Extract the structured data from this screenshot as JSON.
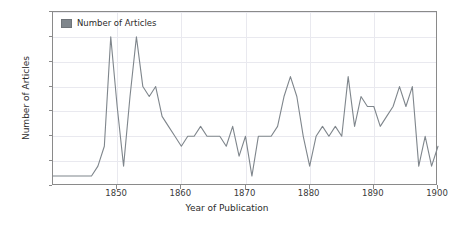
{
  "chart_data": {
    "type": "line",
    "title": "",
    "xlabel": "Year of Publication",
    "ylabel": "Number of Articles",
    "xlim": [
      1840,
      1900
    ],
    "ylim": [
      0,
      17.5
    ],
    "grid": true,
    "legend_position": "upper-left",
    "series": [
      {
        "name": "Number of Articles",
        "color": "#7f868c",
        "x": [
          1840,
          1841,
          1842,
          1843,
          1844,
          1845,
          1846,
          1847,
          1848,
          1849,
          1850,
          1851,
          1852,
          1853,
          1854,
          1855,
          1856,
          1857,
          1858,
          1859,
          1860,
          1861,
          1862,
          1863,
          1864,
          1865,
          1866,
          1867,
          1868,
          1869,
          1870,
          1871,
          1872,
          1873,
          1874,
          1875,
          1876,
          1877,
          1878,
          1879,
          1880,
          1881,
          1882,
          1883,
          1884,
          1885,
          1886,
          1887,
          1888,
          1889,
          1890,
          1891,
          1892,
          1893,
          1894,
          1895,
          1896,
          1897,
          1898,
          1899,
          1900
        ],
        "values": [
          1,
          1,
          1,
          1,
          1,
          1,
          1,
          2,
          4,
          15,
          8,
          2,
          9,
          15,
          10,
          9,
          10,
          7,
          6,
          5,
          4,
          5,
          5,
          6,
          5,
          5,
          5,
          4,
          6,
          3,
          5,
          1,
          5,
          5,
          5,
          6,
          9,
          11,
          9,
          5,
          2,
          5,
          6,
          5,
          6,
          5,
          11,
          6,
          9,
          8,
          8,
          6,
          7,
          8,
          10,
          8,
          10,
          2,
          5,
          2,
          4
        ]
      }
    ],
    "y_ticks": [
      "0.0",
      "2.5",
      "5.0",
      "7.5",
      "10.0",
      "12.5",
      "15.0",
      "17.5"
    ],
    "y_tick_values": [
      0,
      2.5,
      5,
      7.5,
      10,
      12.5,
      15,
      17.5
    ],
    "x_ticks": [
      "1850",
      "1860",
      "1870",
      "1880",
      "1890",
      "1900"
    ],
    "x_tick_values": [
      1850,
      1860,
      1870,
      1880,
      1890,
      1900
    ]
  },
  "legend": {
    "swatch_name": "legend-color-swatch",
    "label": "Number of Articles"
  },
  "axes": {
    "x_axis_label": "Year of Publication",
    "y_axis_label": "Number of Articles"
  },
  "colors": {
    "line": "#7f868c",
    "grid": "#e9e9ef",
    "frame": "#8a8a8a",
    "text": "#2b2b2b",
    "background": "#ffffff"
  }
}
